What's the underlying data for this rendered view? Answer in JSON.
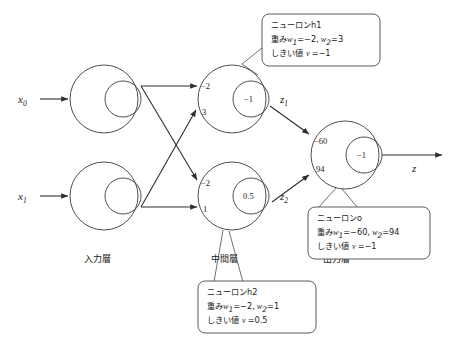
{
  "diagram": {
    "layers": {
      "input_label": "入力層",
      "hidden_label": "中間層",
      "output_label": "出力層"
    },
    "inputs": [
      {
        "name": "x0",
        "label": "x",
        "sub": "0"
      },
      {
        "name": "x1",
        "label": "x",
        "sub": "1"
      }
    ],
    "hidden_neurons": [
      {
        "id": "h1",
        "w1": "−2",
        "w2": "3",
        "threshold": "−1",
        "output_label": "z",
        "output_sub": "1"
      },
      {
        "id": "h2",
        "w1": "−2",
        "w2": "1",
        "threshold": "0.5",
        "output_label": "z",
        "output_sub": "2"
      }
    ],
    "output_neuron": {
      "id": "o",
      "w1": "−60",
      "w2": "94",
      "threshold": "−1",
      "output_label": "z"
    },
    "callouts": [
      {
        "name": "callout-h1",
        "line1": "ニューロンh1",
        "line2_prefix": "重み",
        "line2_w1": "w",
        "line2_w1_sub": "1",
        "line2_w1_val": "=−2,",
        "line2_w2": "w",
        "line2_w2_sub": "2",
        "line2_w2_val": "=3",
        "line3_prefix": "しきい値",
        "line3_var": "v",
        "line3_val": "=−1"
      },
      {
        "name": "callout-h2",
        "line1": "ニューロンh2",
        "line2_prefix": "重み",
        "line2_w1": "w",
        "line2_w1_sub": "1",
        "line2_w1_val": "=−2,",
        "line2_w2": "w",
        "line2_w2_sub": "2",
        "line2_w2_val": "=1",
        "line3_prefix": "しきい値",
        "line3_var": "v",
        "line3_val": "=0.5"
      },
      {
        "name": "callout-output",
        "line1": "ニューロンo",
        "line2_prefix": "重み",
        "line2_w1": "w",
        "line2_w1_sub": "1",
        "line2_w1_val": "=−60,",
        "line2_w2": "w",
        "line2_w2_sub": "2",
        "line2_w2_val": "=94",
        "line3_prefix": "しきい値",
        "line3_var": "v",
        "line3_val": "=−1"
      }
    ],
    "colors": {
      "stroke": "#3a3a3a",
      "edge": "#2e2e2e",
      "text": "#1b1b1b",
      "background": "#ffffff"
    }
  }
}
